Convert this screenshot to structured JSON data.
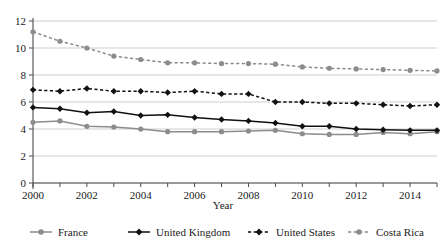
{
  "chart_data": {
    "type": "line",
    "title": "",
    "xlabel": "Year",
    "ylabel": "",
    "x": [
      2000,
      2001,
      2002,
      2003,
      2004,
      2005,
      2006,
      2007,
      2008,
      2009,
      2010,
      2011,
      2012,
      2013,
      2014,
      2015
    ],
    "xlim": [
      2000,
      2015
    ],
    "ylim": [
      0,
      12
    ],
    "yticks": [
      0,
      2,
      4,
      6,
      8,
      10,
      12
    ],
    "xticks_labeled": [
      2000,
      2002,
      2004,
      2006,
      2008,
      2010,
      2012,
      2014
    ],
    "xticks_all": [
      2000,
      2001,
      2002,
      2003,
      2004,
      2005,
      2006,
      2007,
      2008,
      2009,
      2010,
      2011,
      2012,
      2013,
      2014,
      2015
    ],
    "grid": "horizontal",
    "legend_position": "bottom",
    "series": [
      {
        "name": "France",
        "color": "#8c8c8c",
        "dash": "solid",
        "marker": "circle",
        "values": [
          4.5,
          4.6,
          4.2,
          4.15,
          4.0,
          3.8,
          3.8,
          3.8,
          3.85,
          3.9,
          3.65,
          3.6,
          3.6,
          3.75,
          3.65,
          3.8
        ]
      },
      {
        "name": "United Kingdom",
        "color": "#111111",
        "dash": "solid",
        "marker": "diamond",
        "values": [
          5.6,
          5.5,
          5.2,
          5.3,
          5.0,
          5.05,
          4.85,
          4.7,
          4.6,
          4.45,
          4.2,
          4.2,
          4.0,
          3.95,
          3.9,
          3.9
        ]
      },
      {
        "name": "United States",
        "color": "#111111",
        "dash": "dashed",
        "marker": "diamond",
        "values": [
          6.9,
          6.8,
          7.0,
          6.8,
          6.8,
          6.7,
          6.8,
          6.6,
          6.6,
          6.0,
          6.0,
          5.9,
          5.9,
          5.8,
          5.7,
          5.8
        ]
      },
      {
        "name": "Costa Rica",
        "color": "#8c8c8c",
        "dash": "dashed",
        "marker": "circle",
        "values": [
          11.2,
          10.5,
          10.0,
          9.4,
          9.15,
          8.9,
          8.9,
          8.85,
          8.85,
          8.8,
          8.6,
          8.5,
          8.45,
          8.4,
          8.35,
          8.3
        ]
      }
    ]
  },
  "axis": {
    "y_labels": [
      "12",
      "10",
      "8",
      "6",
      "4",
      "2",
      "0"
    ],
    "x_labels": [
      "2000",
      "2002",
      "2004",
      "2006",
      "2008",
      "2010",
      "2012",
      "2014"
    ],
    "x_title": "Year"
  },
  "legend": {
    "items": [
      {
        "label": "France"
      },
      {
        "label": "United Kingdom"
      },
      {
        "label": "United States"
      },
      {
        "label": "Costa Rica"
      }
    ]
  }
}
